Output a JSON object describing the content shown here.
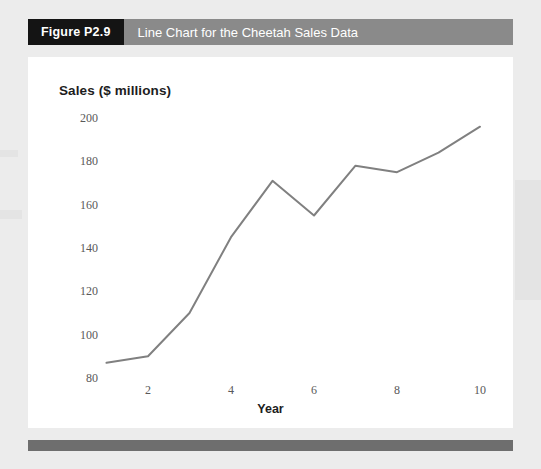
{
  "figure": {
    "number_label": "Figure P2.9",
    "caption": "Line Chart for the Cheetah Sales Data"
  },
  "colors": {
    "badge_background": "#141414",
    "header_background": "#8a8a8a",
    "header_text": "#ffffff",
    "panel_background": "#ffffff",
    "page_background": "#ececec",
    "line": "#808080",
    "tick_text": "#595959",
    "title_text": "#1d1d1d",
    "footer_bar": "#6e6e6e"
  },
  "chart_data": {
    "type": "line",
    "title": "Line Chart for the Cheetah Sales Data",
    "xlabel": "Year",
    "ylabel": "Sales ($ millions)",
    "x": [
      1,
      2,
      3,
      4,
      5,
      6,
      7,
      8,
      9,
      10
    ],
    "values": [
      87,
      90,
      110,
      145,
      171,
      155,
      178,
      175,
      184,
      196
    ],
    "series": [
      {
        "name": "Sales",
        "values": [
          87,
          90,
          110,
          145,
          171,
          155,
          178,
          175,
          184,
          196
        ]
      }
    ],
    "xlim": [
      1,
      10
    ],
    "ylim": [
      80,
      200
    ],
    "xticks": [
      2,
      4,
      6,
      8,
      10
    ],
    "yticks": [
      80,
      100,
      120,
      140,
      160,
      180,
      200
    ],
    "xtick_labels": [
      "2",
      "4",
      "6",
      "8",
      "10"
    ],
    "ytick_labels": [
      "80",
      "100",
      "120",
      "140",
      "160",
      "180",
      "200"
    ],
    "grid": false,
    "legend": false,
    "markers": false
  }
}
